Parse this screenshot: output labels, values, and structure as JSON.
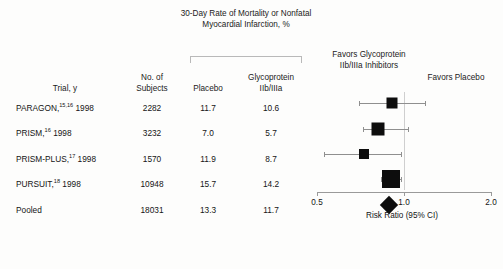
{
  "figure": {
    "spanner_header": "30-Day Rate of Mortality or Nonfatal Myocardial Infarction, %",
    "columns": {
      "trial": "Trial, y",
      "subjects": "No. of Subjects",
      "placebo": "Placebo",
      "glycoprotein": "Glycoprotein IIb/IIIa"
    },
    "favors_left": "Favors Glycoprotein IIb/IIIa Inhibitors",
    "favors_right": "Favors Placebo",
    "axis_title": "Risk Ratio (95% CI)",
    "axis_ticks": [
      "0.5",
      "1.0",
      "2.0"
    ]
  },
  "rows": [
    {
      "trial": "PARAGON,",
      "citation": "15,16",
      "year": " 1998",
      "subjects": "2282",
      "placebo": "11.7",
      "glycoprotein": "10.6"
    },
    {
      "trial": "PRISM,",
      "citation": "16",
      "year": " 1998",
      "subjects": "3232",
      "placebo": "7.0",
      "glycoprotein": "5.7"
    },
    {
      "trial": "PRISM-PLUS,",
      "citation": "17",
      "year": " 1998",
      "subjects": "1570",
      "placebo": "11.9",
      "glycoprotein": "8.7"
    },
    {
      "trial": "PURSUIT,",
      "citation": "18",
      "year": " 1998",
      "subjects": "10948",
      "placebo": "15.7",
      "glycoprotein": "14.2"
    },
    {
      "trial": "Pooled",
      "citation": "",
      "year": "",
      "subjects": "18031",
      "placebo": "13.3",
      "glycoprotein": "11.7"
    }
  ],
  "chart_data": {
    "type": "forest",
    "title": "30-Day Rate of Mortality or Nonfatal Myocardial Infarction, %",
    "xlabel": "Risk Ratio (95% CI)",
    "xscale": "log",
    "xlim": [
      0.5,
      2.0
    ],
    "xticks": [
      0.5,
      1.0,
      2.0
    ],
    "reference_line": 1.0,
    "grid": false,
    "favors_left_label": "Favors Glycoprotein IIb/IIIa Inhibitors",
    "favors_right_label": "Favors Placebo",
    "studies": [
      {
        "name": "PARAGON 1998",
        "n": 2282,
        "placebo_pct": 11.7,
        "treatment_pct": 10.6,
        "risk_ratio": 0.91,
        "ci_low": 0.7,
        "ci_high": 1.18,
        "marker": "square",
        "marker_weight": 11
      },
      {
        "name": "PRISM 1998",
        "n": 3232,
        "placebo_pct": 7.0,
        "treatment_pct": 5.7,
        "risk_ratio": 0.81,
        "ci_low": 0.72,
        "ci_high": 1.03,
        "marker": "square",
        "marker_weight": 13
      },
      {
        "name": "PRISM-PLUS 1998",
        "n": 1570,
        "placebo_pct": 11.9,
        "treatment_pct": 8.7,
        "risk_ratio": 0.73,
        "ci_low": 0.53,
        "ci_high": 0.98,
        "marker": "square",
        "marker_weight": 10
      },
      {
        "name": "PURSUIT 1998",
        "n": 10948,
        "placebo_pct": 15.7,
        "treatment_pct": 14.2,
        "risk_ratio": 0.9,
        "ci_low": 0.83,
        "ci_high": 0.98,
        "marker": "square",
        "marker_weight": 18
      },
      {
        "name": "Pooled",
        "n": 18031,
        "placebo_pct": 13.3,
        "treatment_pct": 11.7,
        "risk_ratio": 0.89,
        "ci_low": 0.83,
        "ci_high": 0.95,
        "marker": "diamond",
        "marker_weight": 13
      }
    ]
  }
}
